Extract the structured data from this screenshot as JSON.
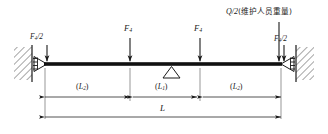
{
  "figure": {
    "colors": {
      "line": "#1a1a1a",
      "beam": "#111111",
      "hatch": "#555555",
      "background": "#ffffff"
    },
    "labels": {
      "left_reaction": {
        "symbol": "F",
        "subscript": "4",
        "suffix": "/2",
        "text": "F4/2"
      },
      "load_1": {
        "symbol": "F",
        "subscript": "4",
        "suffix": "",
        "text": "F4"
      },
      "load_2": {
        "symbol": "F",
        "subscript": "4",
        "suffix": "",
        "text": "F4"
      },
      "right_reaction": {
        "symbol": "F",
        "subscript": "4",
        "suffix": "/2",
        "text": "F4/2"
      },
      "personnel_load": {
        "symbol": "Q",
        "suffix": "/2",
        "note": "(维护人员重量)",
        "text": "Q/2(维护人员重量)"
      }
    },
    "dimensions": {
      "left_span": {
        "symbol": "L",
        "subscript": "2",
        "text": "(L2)"
      },
      "middle_span": {
        "symbol": "L",
        "subscript": "1",
        "text": "(L1)"
      },
      "right_span": {
        "symbol": "L",
        "subscript": "2",
        "text": "(L2)"
      },
      "total": {
        "symbol": "L",
        "subscript": "",
        "text": "L"
      }
    },
    "supports": {
      "left": "pin-support-wall",
      "right": "pin-support-wall",
      "center": "triangle-support"
    }
  }
}
